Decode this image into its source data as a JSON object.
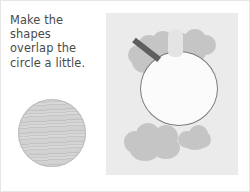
{
  "instruction": {
    "text": "Make the\nshapes\noverlap the\ncircle a little."
  },
  "materials": {
    "circle_label": "textured paper circle"
  },
  "worksheet": {
    "outline_circle_label": "traced circle outline",
    "shapes": [
      {
        "name": "top-left-blob",
        "label": "torn paper shape"
      },
      {
        "name": "top-right-blob",
        "label": "torn paper shape"
      },
      {
        "name": "top-tab",
        "label": "paper tab"
      },
      {
        "name": "bottom-left-blob",
        "label": "torn paper shape"
      },
      {
        "name": "bottom-right-blob",
        "label": "torn paper shape"
      }
    ],
    "tool_label": "pencil"
  },
  "colors": {
    "panel_background": "#ebebeb",
    "shape_fill": "#c5c5c5",
    "shape_fill_light": "#d6d6d6",
    "outline_stroke": "#7b7b7b",
    "tool_fill": "#5e5e5e",
    "text": "#4a4a4a"
  }
}
